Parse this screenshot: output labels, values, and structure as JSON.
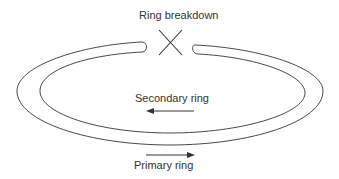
{
  "diagram": {
    "labels": {
      "breakdown": "Ring breakdown",
      "secondary": "Secondary ring",
      "primary": "Primary ring"
    },
    "colors": {
      "stroke": "#333333",
      "background": "#ffffff"
    },
    "arrows": {
      "secondary_direction": "left",
      "primary_direction": "right"
    },
    "break_marker": "X"
  }
}
